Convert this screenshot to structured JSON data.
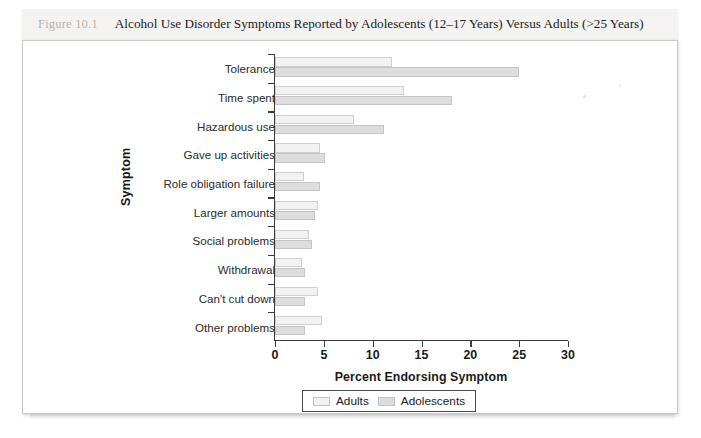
{
  "caption": {
    "figure_number": "Figure 10.1",
    "title": "Alcohol Use Disorder Symptoms Reported by Adolescents (12–17 Years) Versus Adults (>25 Years)"
  },
  "chart_data": {
    "type": "bar",
    "orientation": "horizontal",
    "title": "Alcohol Use Disorder Symptoms Reported by Adolescents (12–17 Years) Versus Adults (>25 Years)",
    "xlabel": "Percent Endorsing Symptom",
    "ylabel": "Symptom",
    "xlim": [
      0,
      30
    ],
    "xticks": [
      0,
      5,
      10,
      15,
      20,
      25,
      30
    ],
    "grid": false,
    "legend_position": "bottom",
    "categories": [
      "Tolerance",
      "Time spent",
      "Hazardous use",
      "Gave up activities",
      "Role obligation failure",
      "Larger amounts",
      "Social problems",
      "Withdrawal",
      "Can't cut down",
      "Other problems"
    ],
    "series": [
      {
        "name": "Adults",
        "color": "#f2f2f2",
        "values": [
          12.0,
          13.2,
          8.1,
          4.6,
          3.0,
          4.4,
          3.5,
          2.8,
          4.4,
          4.8
        ]
      },
      {
        "name": "Adolescents",
        "color": "#dddddd",
        "values": [
          25.0,
          18.1,
          11.2,
          5.1,
          4.6,
          4.1,
          3.8,
          3.1,
          3.1,
          3.1
        ]
      }
    ]
  },
  "legend": {
    "items": [
      {
        "label": "Adults",
        "color": "#f2f2f2"
      },
      {
        "label": "Adolescents",
        "color": "#dcdcdc"
      }
    ]
  }
}
